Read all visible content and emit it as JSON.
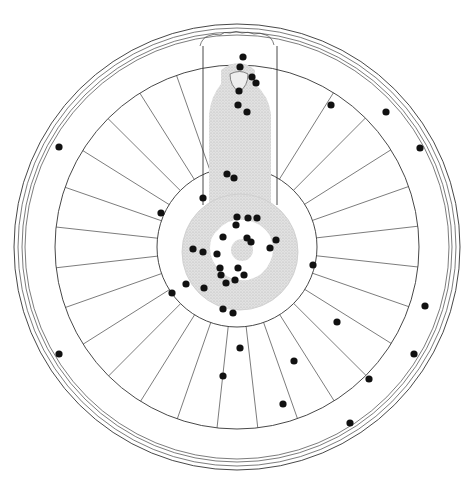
{
  "figure": {
    "type": "archaeological-site-plan",
    "colors": {
      "ink": "#333333",
      "dot": "#111111",
      "hatch": "#d6d6d6",
      "background": "#ffffff"
    },
    "geometry": {
      "center": [
        237,
        247
      ],
      "outer_rim_radii": [
        223,
        219,
        215,
        212
      ],
      "wheel_outer_radius": 182,
      "hub_radius": 80,
      "spoke_count": 28
    },
    "find_spots": [
      [
        243,
        57
      ],
      [
        240,
        67
      ],
      [
        252,
        77
      ],
      [
        256,
        83
      ],
      [
        239,
        91
      ],
      [
        238,
        105
      ],
      [
        247,
        112
      ],
      [
        227,
        174
      ],
      [
        234,
        178
      ],
      [
        203,
        198
      ],
      [
        161,
        213
      ],
      [
        237,
        217
      ],
      [
        248,
        218
      ],
      [
        257,
        218
      ],
      [
        236,
        225
      ],
      [
        223,
        237
      ],
      [
        247,
        238
      ],
      [
        251,
        242
      ],
      [
        276,
        240
      ],
      [
        270,
        248
      ],
      [
        193,
        249
      ],
      [
        203,
        252
      ],
      [
        217,
        254
      ],
      [
        220,
        268
      ],
      [
        221,
        275
      ],
      [
        238,
        268
      ],
      [
        244,
        275
      ],
      [
        226,
        283
      ],
      [
        235,
        280
      ],
      [
        186,
        284
      ],
      [
        172,
        293
      ],
      [
        204,
        288
      ],
      [
        223,
        309
      ],
      [
        233,
        313
      ],
      [
        240,
        348
      ],
      [
        223,
        376
      ],
      [
        294,
        361
      ],
      [
        283,
        404
      ],
      [
        313,
        265
      ],
      [
        337,
        322
      ],
      [
        425,
        306
      ],
      [
        414,
        354
      ],
      [
        369,
        379
      ],
      [
        350,
        423
      ],
      [
        331,
        105
      ],
      [
        386,
        112
      ],
      [
        420,
        148
      ],
      [
        59,
        147
      ],
      [
        59,
        354
      ]
    ]
  }
}
